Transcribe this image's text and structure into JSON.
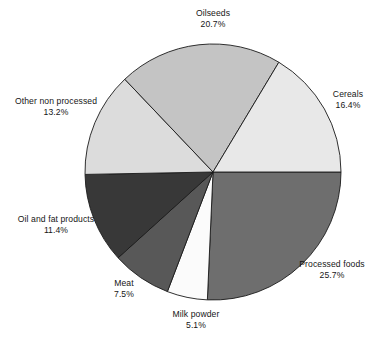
{
  "chart_data": {
    "type": "pie",
    "title": "",
    "xlabel": "",
    "ylabel": "",
    "unit": "percent",
    "total": 100.0,
    "legend_position": "none",
    "labels_outside": true,
    "grid": false,
    "categories": [
      "Processed foods",
      "Milk powder",
      "Meat",
      "Oil and fat products",
      "Other non processed",
      "Oilseeds",
      "Cereals"
    ],
    "values": [
      25.7,
      5.1,
      7.5,
      11.4,
      13.2,
      20.7,
      16.4
    ],
    "slices": [
      {
        "name": "Processed foods",
        "value": 25.7,
        "value_text": "25.7%",
        "color": "#6e6e6e",
        "start_angle": 0,
        "end_angle": 92.52
      },
      {
        "name": "Milk powder",
        "value": 5.1,
        "value_text": "5.1%",
        "color": "#fbfbfb",
        "start_angle": 92.52,
        "end_angle": 110.88
      },
      {
        "name": "Meat",
        "value": 7.5,
        "value_text": "7.5%",
        "color": "#585858",
        "start_angle": 110.88,
        "end_angle": 137.88
      },
      {
        "name": "Oil and fat products",
        "value": 11.4,
        "value_text": "11.4%",
        "color": "#383838",
        "start_angle": 137.88,
        "end_angle": 178.92
      },
      {
        "name": "Other non processed",
        "value": 13.2,
        "value_text": "13.2%",
        "color": "#dcdcdc",
        "start_angle": 178.92,
        "end_angle": 226.44
      },
      {
        "name": "Oilseeds",
        "value": 20.7,
        "value_text": "20.7%",
        "color": "#c4c4c4",
        "start_angle": 226.44,
        "end_angle": 300.96
      },
      {
        "name": "Cereals",
        "value": 16.4,
        "value_text": "16.4%",
        "color": "#e8e8e8",
        "start_angle": 300.96,
        "end_angle": 360
      }
    ],
    "geometry": {
      "center_x": 213,
      "center_y": 172,
      "radius": 128
    },
    "stroke_color": "#1a1a1a"
  },
  "labels": {
    "oilseeds": {
      "name": "Oilseeds",
      "pct": "20.7%"
    },
    "cereals": {
      "name": "Cereals",
      "pct": "16.4%"
    },
    "processed": {
      "name": "Processed foods",
      "pct": "25.7%"
    },
    "milk": {
      "name": "Milk powder",
      "pct": "5.1%"
    },
    "meat": {
      "name": "Meat",
      "pct": "7.5%"
    },
    "oilfat": {
      "name": "Oil and fat products",
      "pct": "11.4%"
    },
    "othernon": {
      "name": "Other non processed",
      "pct": "13.2%"
    }
  }
}
